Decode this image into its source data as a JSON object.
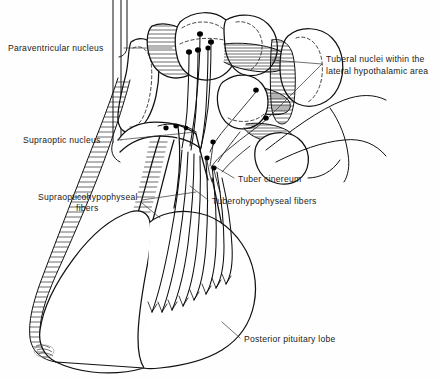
{
  "figure": {
    "background_color": "#fefefe",
    "ink_color": "#111111",
    "label_color": "#1a1a1a",
    "caption_color": "#9a9a9a",
    "width": 441,
    "height": 379
  },
  "labels": {
    "paraventricular_nucleus": "Paraventricular nucleus",
    "tuberal_nuclei_line1": "Tuberal nuclei within the",
    "tuberal_nuclei_line2": "lateral hypothalamic area",
    "supraoptic_nucleus": "Supraoptic nucleus",
    "supraopticohypophyseal_line1": "Supraopticohypophyseal",
    "supraopticohypophyseal_line2": "fibers",
    "tuber_cinereum": "Tuber cinereum",
    "tuberohypophyseal_fibers": "Tuberohypophyseal fibers",
    "posterior_pituitary_lobe": "Posterior pituitary lobe"
  },
  "caption": {
    "text": ""
  },
  "structures": [
    {
      "name": "paraventricular-nucleus",
      "kind": "nucleus"
    },
    {
      "name": "tuberal-nuclei",
      "kind": "nucleus"
    },
    {
      "name": "supraoptic-nucleus",
      "kind": "nucleus"
    },
    {
      "name": "tuber-cinereum",
      "kind": "region"
    },
    {
      "name": "infundibular-stalk",
      "kind": "stalk"
    },
    {
      "name": "posterior-pituitary-lobe",
      "kind": "gland"
    },
    {
      "name": "anterior-pituitary-lobe",
      "kind": "gland"
    },
    {
      "name": "optic-chiasm",
      "kind": "region"
    },
    {
      "name": "mammillary-body",
      "kind": "region"
    },
    {
      "name": "supraopticohypophyseal-tract",
      "kind": "fiber-tract"
    },
    {
      "name": "tuberohypophyseal-tract",
      "kind": "fiber-tract"
    }
  ]
}
